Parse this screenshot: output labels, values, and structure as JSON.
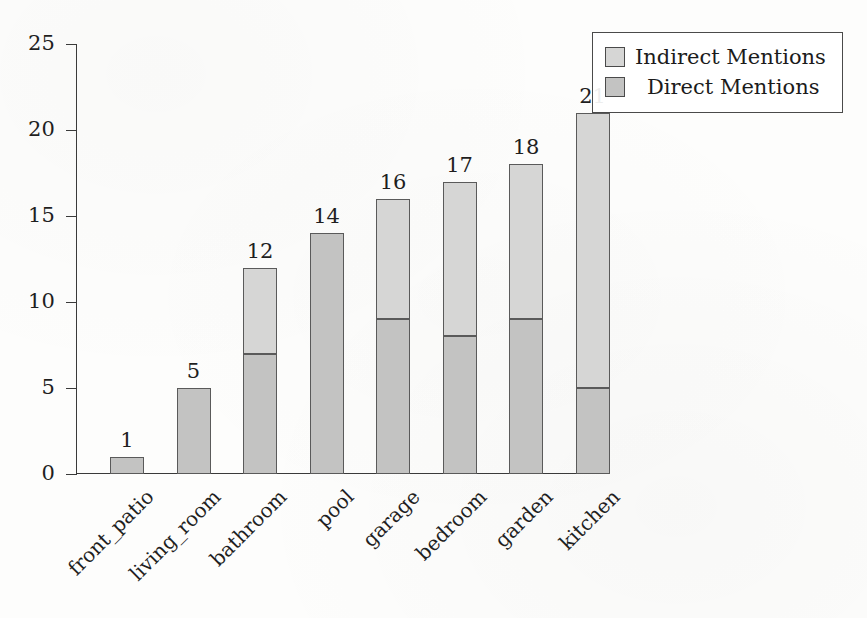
{
  "chart_data": {
    "type": "bar",
    "subtype": "stacked-bar-vertical",
    "title": "",
    "xlabel": "",
    "ylabel": "",
    "categories": [
      "front_patio",
      "living_room",
      "bathroom",
      "pool",
      "garage",
      "bedroom",
      "garden",
      "kitchen"
    ],
    "series": [
      {
        "name": "Direct Mentions",
        "values": [
          1,
          5,
          7,
          14,
          9,
          8,
          9,
          5
        ],
        "color": "#c3c3c2",
        "stack_order": "bottom"
      },
      {
        "name": "Indirect Mentions",
        "values": [
          0,
          0,
          5,
          0,
          7,
          9,
          9,
          16
        ],
        "color": "#d6d6d5",
        "stack_order": "top"
      }
    ],
    "totals": [
      1,
      5,
      12,
      14,
      16,
      17,
      18,
      21
    ],
    "total_labels": [
      "1",
      "5",
      "12",
      "14",
      "16",
      "17",
      "18",
      "21"
    ],
    "ylim": [
      0,
      25
    ],
    "yticks": [
      0,
      5,
      10,
      15,
      20,
      25
    ],
    "ytick_labels": [
      "0",
      "5",
      "10",
      "15",
      "20",
      "25"
    ],
    "grid": false,
    "legend_position": "top-right",
    "xtick_rotation_degrees": -45
  },
  "legend": {
    "entries": [
      {
        "label": "Indirect Mentions",
        "swatch": "light-gray-square"
      },
      {
        "label": "Direct Mentions",
        "swatch": "gray-square"
      }
    ]
  },
  "axes": {
    "y_tick_labels": [
      "25",
      "20",
      "15",
      "10",
      "5",
      "0"
    ],
    "x_tick_labels": [
      "front_patio",
      "living_room",
      "bathroom",
      "pool",
      "garage",
      "bedroom",
      "garden",
      "kitchen"
    ]
  },
  "bar_labels": [
    "1",
    "5",
    "12",
    "14",
    "16",
    "17",
    "18",
    "21"
  ]
}
